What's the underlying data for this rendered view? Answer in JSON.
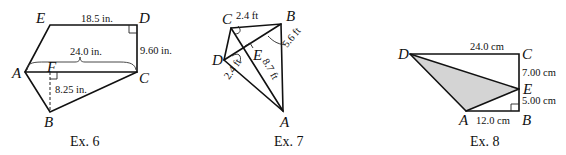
{
  "figures": [
    {
      "caption": "Ex. 6",
      "vertices": {
        "A": "A",
        "B": "B",
        "C": "C",
        "D": "D",
        "E": "E",
        "F": "F"
      },
      "measurements": {
        "ED": "18.5 in.",
        "AC": "24.0 in.",
        "DC": "9.60 in.",
        "FB": "8.25 in."
      },
      "right_angles": [
        "D",
        "F"
      ]
    },
    {
      "caption": "Ex. 7",
      "vertices": {
        "A": "A",
        "B": "B",
        "C": "C",
        "D": "D",
        "E": "E"
      },
      "measurements": {
        "CE": "2.4 ft",
        "BE": "5.6 ft",
        "DE": "2.4 ft",
        "AE": "8.7 ft"
      },
      "right_angles": [
        "E"
      ]
    },
    {
      "caption": "Ex. 8",
      "vertices": {
        "A": "A",
        "B": "B",
        "C": "C",
        "D": "D",
        "E": "E"
      },
      "measurements": {
        "DC": "24.0 cm",
        "CE": "7.00 cm",
        "EB": "5.00 cm",
        "AB": "12.0 cm"
      },
      "right_angles": [
        "B"
      ],
      "shaded_region": "triangle DAE",
      "shade_color": "#d4d4d4"
    }
  ]
}
